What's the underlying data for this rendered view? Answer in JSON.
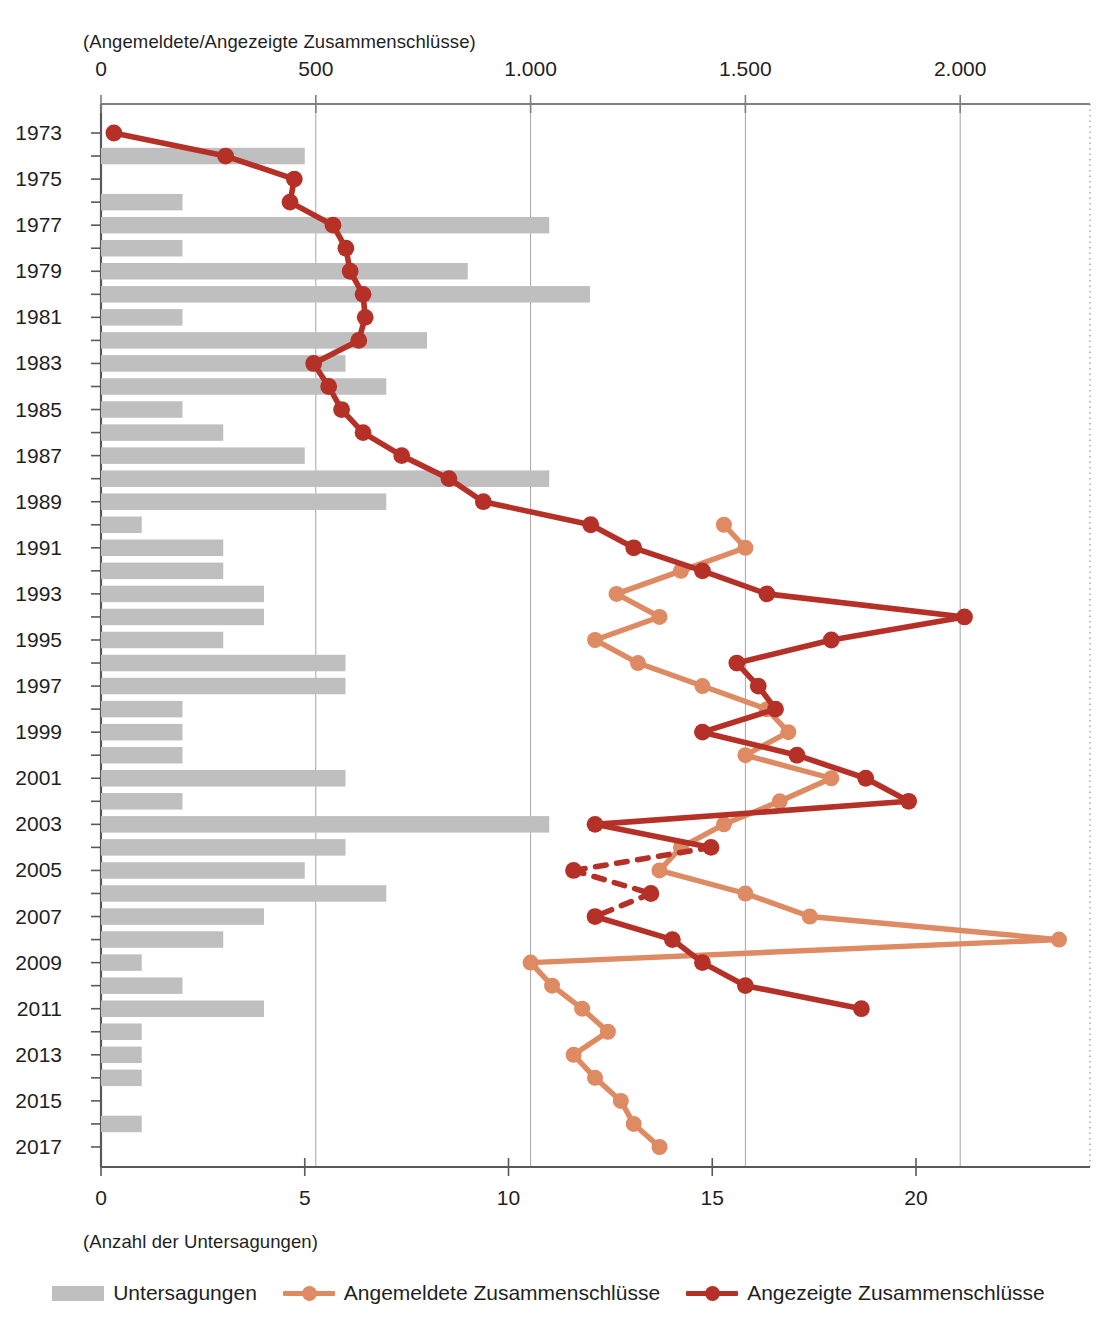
{
  "axes": {
    "top_caption": "(Angemeldete/Angezeigte Zusammenschlüsse)",
    "bottom_caption": "(Anzahl der Untersagungen)",
    "top_ticks": [
      "0",
      "500",
      "1.000",
      "1.500",
      "2.000"
    ],
    "bottom_ticks": [
      "0",
      "5",
      "10",
      "15",
      "20"
    ],
    "year_labels": [
      "1973",
      "1975",
      "1977",
      "1979",
      "1981",
      "1983",
      "1985",
      "1987",
      "1989",
      "1991",
      "1993",
      "1995",
      "1997",
      "1999",
      "2001",
      "2003",
      "2005",
      "2007",
      "2009",
      "2011",
      "2013",
      "2015",
      "2017"
    ]
  },
  "legend": {
    "items": [
      {
        "label": "Untersagungen",
        "type": "bar",
        "color": "#bfbfbf"
      },
      {
        "label": "Angemeldete Zusammenschlüsse",
        "type": "line",
        "color": "#DE8A62"
      },
      {
        "label": "Angezeigte Zusammenschlüsse",
        "type": "line",
        "color": "#B53026"
      }
    ]
  },
  "colors": {
    "bar": "#bfbfbf",
    "angemeldete": "#DE8A62",
    "angezeigte": "#B53026",
    "axis": "#7f7f7f",
    "grid": "#a6a6a6",
    "text": "#1f1f1f"
  },
  "chart_data": {
    "type": "bar",
    "title": "",
    "orientation": "horizontal",
    "xlabel_top": "(Angemeldete/Angezeigte Zusammenschlüsse)",
    "xlabel_bottom": "(Anzahl der Untersagungen)",
    "ylabel": "Jahr",
    "grid": true,
    "legend_position": "bottom",
    "xlim_top": [
      0,
      2300
    ],
    "xlim_bottom": [
      0,
      22.6
    ],
    "categories": [
      1973,
      1974,
      1975,
      1976,
      1977,
      1978,
      1979,
      1980,
      1981,
      1982,
      1983,
      1984,
      1985,
      1986,
      1987,
      1988,
      1989,
      1990,
      1991,
      1992,
      1993,
      1994,
      1995,
      1996,
      1997,
      1998,
      1999,
      2000,
      2001,
      2002,
      2003,
      2004,
      2005,
      2006,
      2007,
      2008,
      2009,
      2010,
      2011,
      2012,
      2013,
      2014,
      2015,
      2016,
      2017
    ],
    "series": [
      {
        "name": "Untersagungen",
        "type": "bar",
        "axis": "bottom",
        "unit": "Anzahl",
        "values": [
          0,
          5,
          0,
          2,
          11,
          2,
          9,
          12,
          2,
          8,
          6,
          7,
          2,
          3,
          5,
          11,
          7,
          1,
          3,
          3,
          4,
          4,
          3,
          6,
          6,
          2,
          2,
          2,
          6,
          2,
          11,
          6,
          5,
          7,
          4,
          3,
          1,
          2,
          4,
          1,
          1,
          1,
          0,
          1,
          null
        ]
      },
      {
        "name": "Angemeldete Zusammenschlüsse",
        "type": "line",
        "axis": "top",
        "unit": "Anzahl",
        "values": [
          null,
          null,
          null,
          null,
          null,
          null,
          null,
          null,
          null,
          null,
          null,
          null,
          null,
          null,
          null,
          null,
          null,
          1450,
          1500,
          1350,
          1200,
          1300,
          1150,
          1250,
          1400,
          1550,
          1600,
          1500,
          1700,
          1580,
          1450,
          1350,
          1300,
          1500,
          1650,
          2230,
          1000,
          1050,
          1120,
          1180,
          1100,
          1150,
          1210,
          1240,
          1300
        ]
      },
      {
        "name": "Angezeigte Zusammenschlüsse",
        "type": "line",
        "axis": "top",
        "unit": "Anzahl",
        "values": [
          30,
          290,
          450,
          440,
          540,
          570,
          580,
          610,
          615,
          600,
          495,
          530,
          560,
          610,
          700,
          810,
          890,
          1140,
          1240,
          1400,
          1550,
          2010,
          1700,
          1480,
          1530,
          1570,
          1400,
          1620,
          1780,
          1880,
          1150,
          1420,
          1100,
          1280,
          1150,
          1330,
          1400,
          1500,
          1770,
          null,
          null,
          null,
          null,
          null,
          null
        ],
        "dashed_from": 2004,
        "dashed_to": 2007
      }
    ]
  }
}
